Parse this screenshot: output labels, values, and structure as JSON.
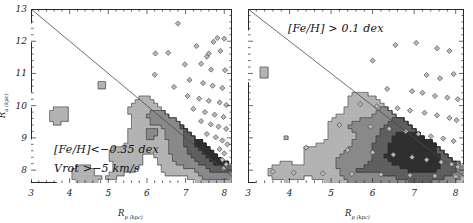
{
  "figure": {
    "background": "#ffffff",
    "foreground": "#2a2a2a"
  },
  "panels": [
    {
      "id": "left",
      "xlabel": "R",
      "xlabel_sub": "p (kpc)",
      "ylabel": "R",
      "ylabel_sub": "a (kpc)",
      "annotations": [
        "[Fe/H]<−0.35 dex",
        "Vrot >−5 km/s"
      ],
      "xticks": [
        "3",
        "4",
        "5",
        "6",
        "7",
        "8"
      ],
      "yticks": [
        "13",
        "12",
        "11",
        "10",
        "9",
        "8"
      ]
    },
    {
      "id": "right",
      "xlabel": "R",
      "xlabel_sub": "p (kpc)",
      "annotations": [
        "[Fe/H] > 0.1 dex"
      ],
      "xticks": [
        "3",
        "4",
        "5",
        "6",
        "7",
        "8"
      ],
      "yticks": [
        "13",
        "12",
        "11",
        "10",
        "9",
        "8"
      ]
    }
  ],
  "chart_data": {
    "type": "scatter",
    "title": "",
    "xlabel": "R_p (kpc)",
    "ylabel": "R_a (kpc)",
    "xlim": [
      3,
      8.2
    ],
    "ylim": [
      7.6,
      13
    ],
    "grid": false,
    "legend": "none",
    "contour_levels": [
      "#ffffff",
      "#b4b4b4",
      "#8a8a8a",
      "#606060",
      "#303030"
    ],
    "reference_line": {
      "label": "R_a = R_p",
      "from": [
        3,
        13
      ],
      "to": [
        8.2,
        7.8
      ]
    },
    "panels": [
      {
        "name": "metal-poor",
        "selection": "[Fe/H] < -0.35 dex, Vrot > -5 km/s",
        "density_peak": [
          7.9,
          8.6
        ],
        "points": [
          [
            6.8,
            12.55
          ],
          [
            6.22,
            11.62
          ],
          [
            6.55,
            11.64
          ],
          [
            7.28,
            11.85
          ],
          [
            7.55,
            11.52
          ],
          [
            7.82,
            12.1
          ],
          [
            8.0,
            12.08
          ],
          [
            7.72,
            11.98
          ],
          [
            7.9,
            11.7
          ],
          [
            7.6,
            11.62
          ],
          [
            6.2,
            10.96
          ],
          [
            6.98,
            11.28
          ],
          [
            7.4,
            11.3
          ],
          [
            7.66,
            11.12
          ],
          [
            8.02,
            11.1
          ],
          [
            7.1,
            10.8
          ],
          [
            7.45,
            10.7
          ],
          [
            7.7,
            10.62
          ],
          [
            7.95,
            10.55
          ],
          [
            6.7,
            10.58
          ],
          [
            7.05,
            10.3
          ],
          [
            7.35,
            10.22
          ],
          [
            7.6,
            10.15
          ],
          [
            7.88,
            10.1
          ],
          [
            8.05,
            10.02
          ],
          [
            7.2,
            9.9
          ],
          [
            7.5,
            9.8
          ],
          [
            7.75,
            9.72
          ],
          [
            7.98,
            9.65
          ],
          [
            7.4,
            9.52
          ],
          [
            7.65,
            9.42
          ],
          [
            7.85,
            9.35
          ],
          [
            8.05,
            9.28
          ],
          [
            7.55,
            9.12
          ],
          [
            7.78,
            9.02
          ],
          [
            7.95,
            8.92
          ],
          [
            8.08,
            8.8
          ],
          [
            7.88,
            8.65
          ],
          [
            8.0,
            8.52
          ],
          [
            7.95,
            8.32
          ],
          [
            8.05,
            8.18
          ],
          [
            7.98,
            8.05
          ]
        ]
      },
      {
        "name": "metal-rich",
        "selection": "[Fe/H] > 0.1 dex",
        "density_peak": [
          7.3,
          8.2
        ],
        "points": [
          [
            6.55,
            11.88
          ],
          [
            7.05,
            11.95
          ],
          [
            7.55,
            11.78
          ],
          [
            7.85,
            11.7
          ],
          [
            6.0,
            11.4
          ],
          [
            7.3,
            10.95
          ],
          [
            7.95,
            10.98
          ],
          [
            7.62,
            10.85
          ],
          [
            6.35,
            10.52
          ],
          [
            6.95,
            10.45
          ],
          [
            7.2,
            10.4
          ],
          [
            7.5,
            10.3
          ],
          [
            7.8,
            10.25
          ],
          [
            8.05,
            10.2
          ],
          [
            5.7,
            10.05
          ],
          [
            6.1,
            9.98
          ],
          [
            6.6,
            9.92
          ],
          [
            6.9,
            9.85
          ],
          [
            7.25,
            9.78
          ],
          [
            7.55,
            9.7
          ],
          [
            7.85,
            9.62
          ],
          [
            8.02,
            9.55
          ],
          [
            5.2,
            9.4
          ],
          [
            5.95,
            9.35
          ],
          [
            6.4,
            9.28
          ],
          [
            6.8,
            9.2
          ],
          [
            7.1,
            9.12
          ],
          [
            7.4,
            9.05
          ],
          [
            7.7,
            8.98
          ],
          [
            7.95,
            8.9
          ],
          [
            4.4,
            8.7
          ],
          [
            5.4,
            8.62
          ],
          [
            6.0,
            8.55
          ],
          [
            6.5,
            8.48
          ],
          [
            6.95,
            8.4
          ],
          [
            7.3,
            8.32
          ],
          [
            7.65,
            8.25
          ],
          [
            7.9,
            8.18
          ],
          [
            8.05,
            8.1
          ],
          [
            3.6,
            7.95
          ],
          [
            4.1,
            7.92
          ],
          [
            4.8,
            7.9
          ],
          [
            5.5,
            7.88
          ],
          [
            6.2,
            7.86
          ],
          [
            6.9,
            7.84
          ],
          [
            7.5,
            7.82
          ],
          [
            8.0,
            7.8
          ]
        ]
      }
    ]
  }
}
